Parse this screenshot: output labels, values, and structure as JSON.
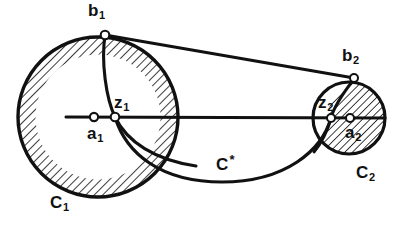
{
  "figure": {
    "background_color": "#ffffff",
    "ink_color": "#111111",
    "hatch_color": "#1a1a1a",
    "width": 413,
    "height": 228
  },
  "labels": {
    "b1": {
      "base": "b",
      "sub": "1"
    },
    "b2": {
      "base": "b",
      "sub": "2"
    },
    "z1": {
      "base": "z",
      "sub": "1"
    },
    "z2": {
      "base": "z",
      "sub": "2"
    },
    "a1": {
      "base": "a",
      "sub": "1"
    },
    "a2": {
      "base": "a",
      "sub": "2"
    },
    "c1": {
      "base": "C",
      "sub": "1"
    },
    "c2": {
      "base": "C",
      "sub": "2"
    },
    "cstar": {
      "base": "C",
      "sup": "*"
    }
  },
  "geometry": {
    "circle_1": {
      "name": "C1",
      "cx": 98,
      "cy": 117,
      "r": 80,
      "hatch_band_width": 17
    },
    "circle_2": {
      "name": "C2",
      "cx": 349,
      "cy": 118,
      "r": 36,
      "hatched": true
    },
    "points": {
      "a1": {
        "x": 94,
        "y": 117
      },
      "z1": {
        "x": 115,
        "y": 117
      },
      "b1": {
        "x": 105,
        "y": 35
      },
      "a2": {
        "x": 350,
        "y": 118
      },
      "z2": {
        "x": 331,
        "y": 118
      },
      "b2": {
        "x": 354,
        "y": 78
      }
    },
    "axis_line": {
      "x1": 66,
      "y1": 117,
      "x2": 385,
      "y2": 118
    },
    "tangent_line": {
      "x1": 105,
      "y1": 35,
      "x2": 354,
      "y2": 78
    },
    "curve_cstar": {
      "from": "z1",
      "to": "z2",
      "sag_y": 182
    },
    "inner_arc_1": {
      "from": "b1",
      "through": "z1",
      "to_bottom_x": 196,
      "to_bottom_y": 165
    },
    "inner_arc_2": {
      "from": "b2",
      "through": "z2",
      "to_bottom_x": 318,
      "to_bottom_y": 152
    }
  }
}
